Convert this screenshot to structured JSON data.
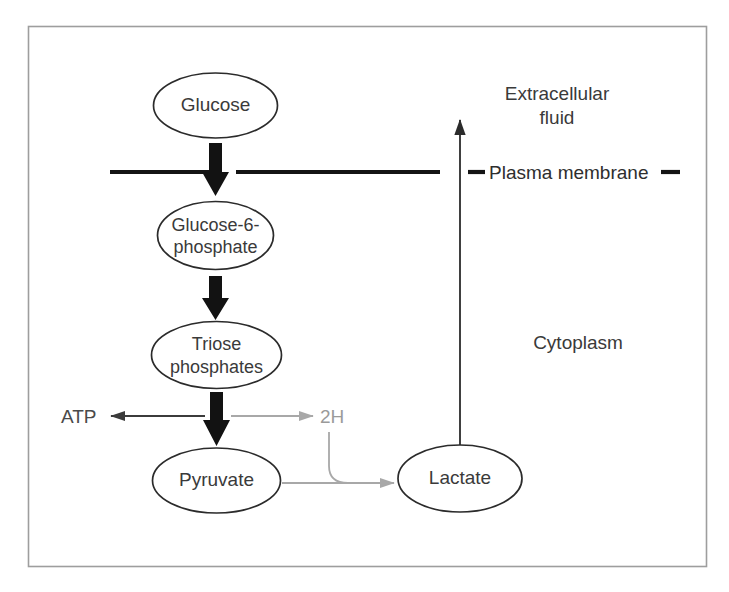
{
  "figure": {
    "frame_color": "#9e9e9e",
    "background": "#ffffff"
  },
  "nodes": [
    {
      "id": "glucose",
      "label": "Glucose",
      "lines": [
        "Glucose"
      ]
    },
    {
      "id": "glucose-6-phosphate",
      "label": "Glucose-6-phosphate",
      "lines": [
        "Glucose-6-",
        "phosphate"
      ]
    },
    {
      "id": "triose-phosphates",
      "label": "Triose phosphates",
      "lines": [
        "Triose",
        "phosphates"
      ]
    },
    {
      "id": "pyruvate",
      "label": "Pyruvate",
      "lines": [
        "Pyruvate"
      ]
    },
    {
      "id": "lactate",
      "label": "Lactate",
      "lines": [
        "Lactate"
      ]
    }
  ],
  "regions": {
    "extracellular": {
      "lines": [
        "Extracellular",
        "fluid"
      ]
    },
    "cytoplasm": {
      "label": "Cytoplasm"
    },
    "membrane": {
      "label": "Plasma membrane",
      "color": "#141414"
    }
  },
  "side_labels": {
    "atp": {
      "label": "ATP",
      "color": "#4a4a4a"
    },
    "two_h": {
      "label": "2H",
      "color": "#9a9a9a"
    }
  },
  "colors": {
    "node_stroke": "#2b2b2b",
    "text": "#3a3a3a",
    "gray_arrow": "#a8a8a8",
    "dark_arrow": "#3b3b3b",
    "thick_arrow": "#121212"
  }
}
